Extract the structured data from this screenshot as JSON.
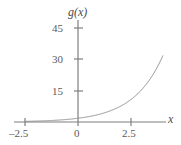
{
  "figure": {
    "background_color": "#ffffff",
    "axis_color": "#7f7f7f",
    "curve_color": "#8c8c8c",
    "text_color": "#5a5a5a"
  },
  "chart_data": {
    "type": "line",
    "title": "",
    "subtitle": "",
    "xlabel": "x",
    "ylabel": "g(x)",
    "grid": false,
    "legend": null,
    "xlim": [
      -2.9,
      4.4
    ],
    "ylim": [
      -2,
      52
    ],
    "xticks": [
      -2.5,
      0,
      2.5
    ],
    "xtick_labels": [
      "–2.5",
      "0",
      "2.5"
    ],
    "yticks": [
      15,
      30,
      45
    ],
    "ytick_labels": [
      "15",
      "30",
      "45"
    ],
    "series": [
      {
        "name": "g(x)",
        "description": "increasing exponential curve",
        "x": [
          -2.5,
          -2.0,
          -1.5,
          -1.0,
          -0.5,
          0.0,
          0.5,
          1.0,
          1.5,
          2.0,
          2.5,
          3.0,
          3.5,
          4.0
        ],
        "y": [
          0.3,
          0.4,
          0.6,
          0.9,
          1.3,
          1.8,
          2.6,
          3.8,
          5.4,
          7.7,
          10.6,
          15.5,
          22.5,
          32.0
        ]
      }
    ]
  },
  "labels": {
    "y_axis_name": "g(x)",
    "x_axis_name": "x",
    "y_45": "45",
    "y_30": "30",
    "y_15": "15",
    "x_neg_25": "–2.5",
    "x_0": "0",
    "x_25": "2.5"
  }
}
